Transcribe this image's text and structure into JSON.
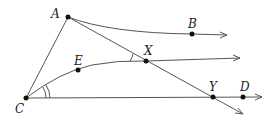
{
  "diagram": {
    "type": "geometry",
    "points": {
      "A": {
        "label": "A",
        "x": 68,
        "y": 17
      },
      "B": {
        "label": "B",
        "x": 192,
        "y": 34
      },
      "C": {
        "label": "C",
        "x": 26,
        "y": 98
      },
      "E": {
        "label": "E",
        "x": 78,
        "y": 70
      },
      "X": {
        "label": "X",
        "x": 146,
        "y": 61
      },
      "Y": {
        "label": "Y",
        "x": 213,
        "y": 97
      },
      "D": {
        "label": "D",
        "x": 243,
        "y": 97
      }
    },
    "segments": [
      "CA",
      "AY"
    ],
    "rays": [
      "AB (curved, arrow)",
      "CEX (curved, arrow)",
      "CYD (arrow)",
      "AXY (arrow)"
    ],
    "angle_marks": [
      {
        "vertex": "C",
        "between": [
          "E",
          "D"
        ],
        "arcs": 2
      },
      {
        "vertex": "X",
        "between": [
          "A",
          "C"
        ],
        "arcs": 1
      }
    ],
    "colors": {
      "line": "#555555",
      "point": "#111111",
      "label": "#222222"
    }
  }
}
